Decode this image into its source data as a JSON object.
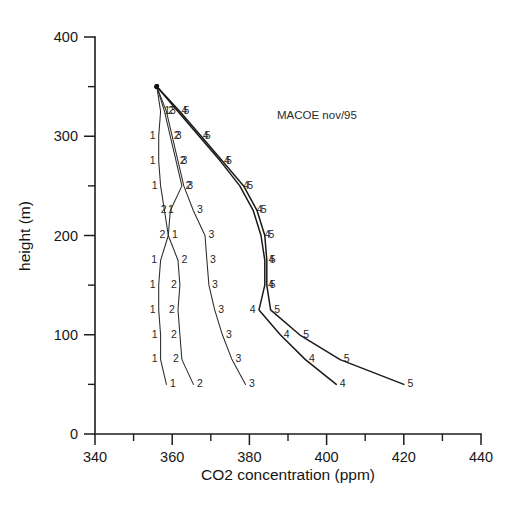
{
  "figure": {
    "annotation": "MACOE nov/95",
    "background_color": "#ffffff",
    "line_color": "#2b2b2b"
  },
  "chart_data": {
    "type": "line",
    "title": "",
    "subtitle": "",
    "annotation": "MACOE nov/95",
    "xlabel": "CO2 concentration (ppm)",
    "ylabel": "height (m)",
    "xlim": [
      340,
      440
    ],
    "ylim": [
      0,
      400
    ],
    "x_ticks_major": [
      340,
      360,
      380,
      400,
      420,
      440
    ],
    "x_ticks_minor": [
      350,
      370,
      390,
      410,
      430
    ],
    "y_ticks_major": [
      0,
      100,
      200,
      300,
      400
    ],
    "y_ticks_minor": [
      50,
      150,
      250,
      350
    ],
    "grid": false,
    "legend_position": "none",
    "orientation": "vertical-profile",
    "x_is_value": true,
    "y_is_height": true,
    "point_labels_are_series_ids": true,
    "series": [
      {
        "name": "1",
        "label": "1",
        "points": [
          {
            "x": 356.0,
            "y": 350
          },
          {
            "x": 357.0,
            "y": 325
          },
          {
            "x": 356.5,
            "y": 300
          },
          {
            "x": 356.5,
            "y": 275
          },
          {
            "x": 357.0,
            "y": 250
          },
          {
            "x": 358.0,
            "y": 225
          },
          {
            "x": 359.0,
            "y": 200
          },
          {
            "x": 357.0,
            "y": 175
          },
          {
            "x": 356.5,
            "y": 150
          },
          {
            "x": 356.5,
            "y": 125
          },
          {
            "x": 357.0,
            "y": 100
          },
          {
            "x": 357.0,
            "y": 75
          },
          {
            "x": 358.5,
            "y": 50
          }
        ]
      },
      {
        "name": "2",
        "label": "2",
        "points": [
          {
            "x": 356.0,
            "y": 350
          },
          {
            "x": 358.0,
            "y": 325
          },
          {
            "x": 359.5,
            "y": 300
          },
          {
            "x": 361.0,
            "y": 275
          },
          {
            "x": 362.5,
            "y": 250
          },
          {
            "x": 359.5,
            "y": 225
          },
          {
            "x": 359.0,
            "y": 200
          },
          {
            "x": 361.5,
            "y": 175
          },
          {
            "x": 362.0,
            "y": 150
          },
          {
            "x": 361.5,
            "y": 125
          },
          {
            "x": 362.0,
            "y": 100
          },
          {
            "x": 362.5,
            "y": 75
          },
          {
            "x": 365.5,
            "y": 50
          }
        ]
      },
      {
        "name": "3",
        "label": "3",
        "points": [
          {
            "x": 356.0,
            "y": 350
          },
          {
            "x": 358.5,
            "y": 325
          },
          {
            "x": 360.0,
            "y": 300
          },
          {
            "x": 361.5,
            "y": 275
          },
          {
            "x": 363.0,
            "y": 250
          },
          {
            "x": 365.5,
            "y": 225
          },
          {
            "x": 368.5,
            "y": 200
          },
          {
            "x": 369.0,
            "y": 175
          },
          {
            "x": 369.5,
            "y": 150
          },
          {
            "x": 371.0,
            "y": 125
          },
          {
            "x": 373.0,
            "y": 100
          },
          {
            "x": 375.5,
            "y": 75
          },
          {
            "x": 379.0,
            "y": 50
          }
        ]
      },
      {
        "name": "4",
        "label": "4",
        "points": [
          {
            "x": 356.0,
            "y": 350
          },
          {
            "x": 361.5,
            "y": 325
          },
          {
            "x": 367.0,
            "y": 300
          },
          {
            "x": 372.5,
            "y": 275
          },
          {
            "x": 377.5,
            "y": 250
          },
          {
            "x": 381.0,
            "y": 225
          },
          {
            "x": 383.0,
            "y": 200
          },
          {
            "x": 384.0,
            "y": 175
          },
          {
            "x": 384.0,
            "y": 150
          },
          {
            "x": 382.5,
            "y": 125
          },
          {
            "x": 388.0,
            "y": 100
          },
          {
            "x": 394.5,
            "y": 75
          },
          {
            "x": 402.5,
            "y": 50
          }
        ]
      },
      {
        "name": "5",
        "label": "5",
        "points": [
          {
            "x": 356.0,
            "y": 350
          },
          {
            "x": 362.0,
            "y": 325
          },
          {
            "x": 367.5,
            "y": 300
          },
          {
            "x": 373.0,
            "y": 275
          },
          {
            "x": 378.5,
            "y": 250
          },
          {
            "x": 382.0,
            "y": 225
          },
          {
            "x": 384.0,
            "y": 200
          },
          {
            "x": 384.5,
            "y": 175
          },
          {
            "x": 384.5,
            "y": 150
          },
          {
            "x": 385.5,
            "y": 125
          },
          {
            "x": 393.0,
            "y": 100
          },
          {
            "x": 403.5,
            "y": 75
          },
          {
            "x": 420.0,
            "y": 50
          }
        ]
      }
    ]
  }
}
